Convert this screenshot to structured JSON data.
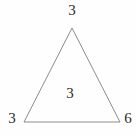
{
  "figure": {
    "kind": "triangle-diagram",
    "background_color": "#fefefe",
    "stroke_color": "#8c8c8c",
    "stroke_width": 1,
    "text_color": "#2b2b2b",
    "vertices": {
      "apex": {
        "x": 72,
        "y": 28
      },
      "bottom_left": {
        "x": 24,
        "y": 122
      },
      "bottom_right": {
        "x": 120,
        "y": 122
      }
    },
    "labels": {
      "apex": "3",
      "bottom_left": "3",
      "bottom_right": "6",
      "interior": "3"
    }
  },
  "chart_data": {
    "type": "diagram",
    "title": "",
    "shape": "triangle",
    "annotations": [
      {
        "name": "apex-label",
        "text": "3",
        "x": 72,
        "y": 11,
        "anchor": "above-apex-vertex"
      },
      {
        "name": "bottom-left-label",
        "text": "3",
        "x": 12,
        "y": 119,
        "anchor": "left-of-bottom-left-vertex"
      },
      {
        "name": "bottom-right-label",
        "text": "6",
        "x": 128,
        "y": 119,
        "anchor": "right-of-bottom-right-vertex"
      },
      {
        "name": "interior-label",
        "text": "3",
        "x": 70,
        "y": 94,
        "anchor": "inside-triangle-center"
      }
    ],
    "values": [
      3,
      3,
      6,
      3
    ],
    "categories": [
      "apex",
      "bottom-left",
      "bottom-right",
      "interior"
    ]
  }
}
